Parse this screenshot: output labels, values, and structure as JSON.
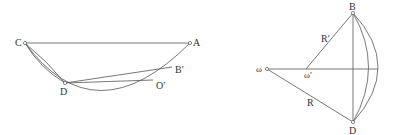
{
  "figures": [
    {
      "name": "left-figure",
      "labels": {
        "C": "C",
        "A": "A",
        "D": "D",
        "B_prime": "B′",
        "O_prime": "O′"
      }
    },
    {
      "name": "right-figure",
      "labels": {
        "B": "B",
        "D": "D",
        "omega": "ω",
        "omega_prime": "ω′",
        "R": "R",
        "R_prime": "R′"
      }
    }
  ],
  "colors": {
    "stroke": "#555555",
    "text": "#333333",
    "background": "#ffffff"
  }
}
